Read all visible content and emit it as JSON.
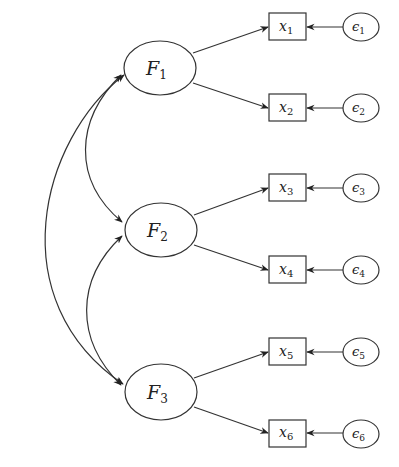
{
  "diagram": {
    "type": "confirmatory-factor-analysis",
    "latent_factors": [
      {
        "id": "F1",
        "symbol": "F",
        "subscript": "1",
        "cx": 160,
        "cy": 68
      },
      {
        "id": "F2",
        "symbol": "F",
        "subscript": "2",
        "cx": 161,
        "cy": 230
      },
      {
        "id": "F3",
        "symbol": "F",
        "subscript": "3",
        "cx": 161,
        "cy": 392
      }
    ],
    "observed_variables": [
      {
        "id": "x1",
        "symbol": "x",
        "subscript": "1",
        "cy": 27,
        "factor": "F1"
      },
      {
        "id": "x2",
        "symbol": "x",
        "subscript": "2",
        "cy": 108,
        "factor": "F1"
      },
      {
        "id": "x3",
        "symbol": "x",
        "subscript": "3",
        "cy": 188,
        "factor": "F2"
      },
      {
        "id": "x4",
        "symbol": "x",
        "subscript": "4",
        "cy": 270,
        "factor": "F2"
      },
      {
        "id": "x5",
        "symbol": "x",
        "subscript": "5",
        "cy": 352,
        "factor": "F3"
      },
      {
        "id": "x6",
        "symbol": "x",
        "subscript": "6",
        "cy": 433,
        "factor": "F3"
      }
    ],
    "errors": [
      {
        "id": "e1",
        "symbol": "ϵ",
        "subscript": "1",
        "target": "x1"
      },
      {
        "id": "e2",
        "symbol": "ϵ",
        "subscript": "2",
        "target": "x2"
      },
      {
        "id": "e3",
        "symbol": "ϵ",
        "subscript": "3",
        "target": "x3"
      },
      {
        "id": "e4",
        "symbol": "ϵ",
        "subscript": "4",
        "target": "x4"
      },
      {
        "id": "e5",
        "symbol": "ϵ",
        "subscript": "5",
        "target": "x5"
      },
      {
        "id": "e6",
        "symbol": "ϵ",
        "subscript": "6",
        "target": "x6"
      }
    ],
    "covariances": [
      {
        "from": "F1",
        "to": "F2",
        "style": "inner-double-arrow"
      },
      {
        "from": "F2",
        "to": "F3",
        "style": "inner-double-arrow"
      },
      {
        "from": "F1",
        "to": "F3",
        "style": "outer-double-arrow"
      }
    ],
    "colors": {
      "stroke": "#333333",
      "background": "#ffffff"
    }
  }
}
